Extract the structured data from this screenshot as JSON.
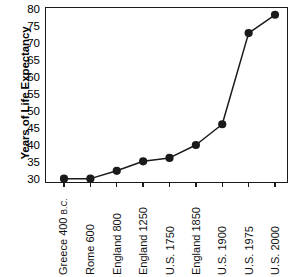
{
  "chart_data": {
    "type": "line",
    "title": "",
    "xlabel": "",
    "ylabel": "Years of Life Expectancy",
    "ylim": [
      30,
      80
    ],
    "ytick_step": 5,
    "yticks": [
      80,
      75,
      70,
      65,
      60,
      55,
      50,
      45,
      40,
      35,
      30
    ],
    "grid": false,
    "legend": "none",
    "marker": "filled-circle",
    "line_color": "#1a1a1a",
    "marker_color": "#1a1a1a",
    "categories": [
      "Greece 400 B.C.",
      "Rome 600",
      "England 800",
      "England 1250",
      "U.S. 1750",
      "England 1850",
      "U.S. 1900",
      "U.S. 1975",
      "U.S. 2000"
    ],
    "category_parts": [
      {
        "main": "Greece 400 ",
        "small": "B.C."
      },
      {
        "main": "Rome 600",
        "small": ""
      },
      {
        "main": "England 800",
        "small": ""
      },
      {
        "main": "England 1250",
        "small": ""
      },
      {
        "main": "U.S. 1750",
        "small": ""
      },
      {
        "main": "England 1850",
        "small": ""
      },
      {
        "main": "U.S. 1900",
        "small": ""
      },
      {
        "main": "U.S. 1975",
        "small": ""
      },
      {
        "main": "U.S. 2000",
        "small": ""
      }
    ],
    "values": [
      30.4,
      30.4,
      32.7,
      35.5,
      36.5,
      40.3,
      46.4,
      73.2,
      78.6
    ]
  }
}
